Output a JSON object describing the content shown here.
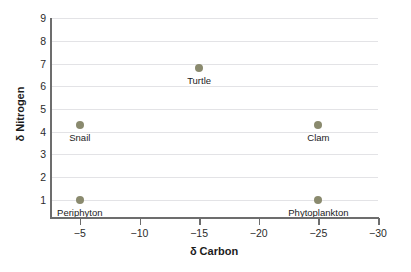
{
  "chart_data": {
    "type": "scatter",
    "title": "",
    "xlabel": "δ Carbon",
    "ylabel": "δ Nitrogen",
    "xlim": [
      -2.5,
      -30
    ],
    "ylim": [
      0.2,
      9
    ],
    "x_ticks": [
      -5,
      -10,
      -15,
      -20,
      -25,
      -30
    ],
    "x_tick_labels": [
      "−5",
      "−10",
      "−15",
      "−20",
      "−25",
      "−30"
    ],
    "y_ticks": [
      1,
      2,
      3,
      4,
      5,
      6,
      7,
      8,
      9
    ],
    "y_tick_labels": [
      "1",
      "2",
      "3",
      "4",
      "5",
      "6",
      "7",
      "8",
      "9"
    ],
    "x_axis_inverted": true,
    "grid": "horizontal",
    "legend": "none",
    "marker_color": "#8a8a6e",
    "grid_color": "#e3e3e6",
    "axis_color": "#6d6d6d",
    "text_color": "#1c1c1c",
    "points": [
      {
        "label": "Periphyton",
        "x": -5,
        "y": 1.0
      },
      {
        "label": "Snail",
        "x": -5,
        "y": 4.3
      },
      {
        "label": "Turtle",
        "x": -15,
        "y": 6.8
      },
      {
        "label": "Clam",
        "x": -25,
        "y": 4.3
      },
      {
        "label": "Phytoplankton",
        "x": -25,
        "y": 1.0
      }
    ]
  }
}
